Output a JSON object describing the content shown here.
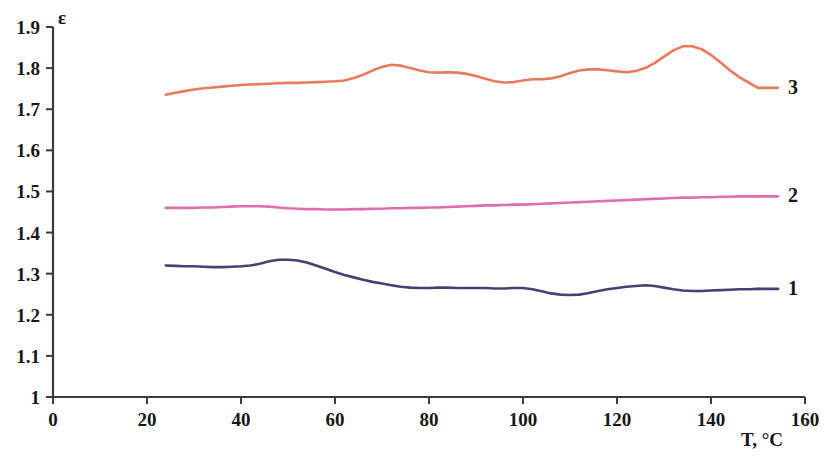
{
  "chart_data": {
    "type": "line",
    "title": "",
    "subtitle": "",
    "xlabel": "T, °C",
    "ylabel": "ε",
    "xlim": [
      0,
      160
    ],
    "ylim": [
      1,
      1.9
    ],
    "xticks": [
      "0",
      "20",
      "40",
      "60",
      "80",
      "100",
      "120",
      "140",
      "160"
    ],
    "xtick_values": [
      0,
      20,
      40,
      60,
      80,
      100,
      120,
      140,
      160
    ],
    "yticks": [
      "1",
      "1.1",
      "1.2",
      "1.3",
      "1.4",
      "1.5",
      "1.6",
      "1.7",
      "1.8",
      "1.9"
    ],
    "ytick_values": [
      1,
      1.1,
      1.2,
      1.3,
      1.4,
      1.5,
      1.6,
      1.7,
      1.8,
      1.9
    ],
    "grid": false,
    "legend_position": "right-inline",
    "colors": {
      "series_1": "#434274",
      "series_2": "#DD6FAF",
      "series_3": "#E87B5C",
      "axis": "#3b3b3b",
      "text": "#171717",
      "background": "#ffffff"
    },
    "series": [
      {
        "name": "1",
        "label": "1",
        "color": "#434274",
        "x": [
          24,
          26,
          28,
          30,
          32,
          34,
          36,
          38,
          40,
          42,
          44,
          46,
          48,
          50,
          52,
          54,
          56,
          58,
          60,
          62,
          64,
          66,
          68,
          70,
          72,
          74,
          76,
          78,
          80,
          82,
          84,
          86,
          88,
          90,
          92,
          94,
          96,
          98,
          100,
          102,
          104,
          106,
          108,
          110,
          112,
          114,
          116,
          118,
          120,
          122,
          124,
          126,
          128,
          130,
          132,
          134,
          136,
          138,
          140,
          142,
          144,
          146,
          148,
          150
        ],
        "y": [
          1.32,
          1.319,
          1.318,
          1.318,
          1.317,
          1.316,
          1.316,
          1.317,
          1.318,
          1.32,
          1.324,
          1.33,
          1.334,
          1.334,
          1.332,
          1.327,
          1.32,
          1.312,
          1.304,
          1.297,
          1.291,
          1.285,
          1.28,
          1.276,
          1.272,
          1.268,
          1.266,
          1.265,
          1.265,
          1.266,
          1.266,
          1.265,
          1.265,
          1.265,
          1.265,
          1.264,
          1.264,
          1.265,
          1.265,
          1.262,
          1.257,
          1.252,
          1.249,
          1.248,
          1.249,
          1.253,
          1.258,
          1.262,
          1.265,
          1.268,
          1.27,
          1.272,
          1.27,
          1.266,
          1.262,
          1.259,
          1.258,
          1.258,
          1.259,
          1.26,
          1.261,
          1.262,
          1.262,
          1.263
        ]
      },
      {
        "name": "2",
        "label": "2",
        "color": "#DD6FAF",
        "x": [
          24,
          26,
          28,
          30,
          32,
          34,
          36,
          38,
          40,
          42,
          44,
          46,
          48,
          50,
          52,
          54,
          56,
          58,
          60,
          62,
          64,
          66,
          68,
          70,
          72,
          74,
          76,
          78,
          80,
          82,
          84,
          86,
          88,
          90,
          92,
          94,
          96,
          98,
          100,
          102,
          104,
          106,
          108,
          110,
          112,
          114,
          116,
          118,
          120,
          122,
          124,
          126,
          128,
          130,
          132,
          134,
          136,
          138,
          140,
          142,
          144,
          146,
          148,
          150
        ],
        "y": [
          1.46,
          1.46,
          1.46,
          1.46,
          1.461,
          1.461,
          1.462,
          1.463,
          1.464,
          1.464,
          1.464,
          1.463,
          1.461,
          1.459,
          1.458,
          1.457,
          1.457,
          1.456,
          1.456,
          1.456,
          1.457,
          1.457,
          1.458,
          1.458,
          1.459,
          1.459,
          1.46,
          1.46,
          1.461,
          1.461,
          1.462,
          1.463,
          1.464,
          1.465,
          1.466,
          1.466,
          1.467,
          1.468,
          1.468,
          1.469,
          1.47,
          1.471,
          1.472,
          1.473,
          1.474,
          1.475,
          1.476,
          1.477,
          1.478,
          1.479,
          1.48,
          1.481,
          1.482,
          1.483,
          1.484,
          1.485,
          1.485,
          1.486,
          1.486,
          1.487,
          1.487,
          1.488,
          1.488,
          1.488
        ]
      },
      {
        "name": "3",
        "label": "3",
        "color": "#E87B5C",
        "x": [
          24,
          26,
          28,
          30,
          32,
          34,
          36,
          38,
          40,
          42,
          44,
          46,
          48,
          50,
          52,
          54,
          56,
          58,
          60,
          62,
          64,
          66,
          68,
          70,
          72,
          74,
          76,
          78,
          80,
          82,
          84,
          86,
          88,
          90,
          92,
          94,
          96,
          98,
          100,
          102,
          104,
          106,
          108,
          110,
          112,
          114,
          116,
          118,
          120,
          122,
          124,
          126,
          128,
          130,
          132,
          134,
          136,
          138,
          140,
          142,
          144,
          146,
          148,
          150
        ],
        "y": [
          1.735,
          1.74,
          1.744,
          1.748,
          1.751,
          1.753,
          1.755,
          1.757,
          1.759,
          1.76,
          1.761,
          1.762,
          1.763,
          1.764,
          1.764,
          1.765,
          1.766,
          1.767,
          1.768,
          1.77,
          1.776,
          1.784,
          1.794,
          1.803,
          1.808,
          1.806,
          1.8,
          1.794,
          1.79,
          1.789,
          1.79,
          1.789,
          1.786,
          1.781,
          1.774,
          1.768,
          1.765,
          1.766,
          1.77,
          1.773,
          1.773,
          1.775,
          1.78,
          1.788,
          1.794,
          1.797,
          1.797,
          1.795,
          1.792,
          1.79,
          1.793,
          1.8,
          1.812,
          1.828,
          1.843,
          1.853,
          1.853,
          1.846,
          1.832,
          1.814,
          1.795,
          1.778,
          1.765,
          1.752
        ]
      }
    ]
  },
  "axis": {
    "y_axis_name": "ε",
    "x_axis_name": "T, °C"
  }
}
